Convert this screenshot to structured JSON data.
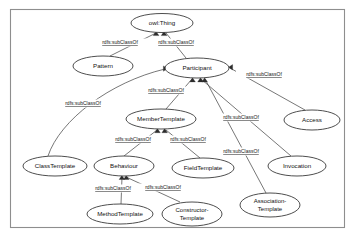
{
  "diagram": {
    "frame": {
      "x": 10,
      "y": 9,
      "width": 335,
      "height": 219
    },
    "edge_relation_label": "rdfs:subClassOf",
    "colors": {
      "background": "#ffffff",
      "node_stroke": "#3a3a3a",
      "node_fill": "#ffffff",
      "edge_stroke": "#4a4a4a",
      "text": "#111111",
      "frame_stroke": "#8e8e8e",
      "arrow_fill": "#2c2c2c"
    },
    "nodes": [
      {
        "id": "owl-thing",
        "label": "owl:Thing",
        "cx": 162,
        "cy": 23,
        "rx": 31,
        "ry": 9.5,
        "lines": [
          "owl:Thing"
        ]
      },
      {
        "id": "pattern",
        "label": "Pattern",
        "cx": 103,
        "cy": 66,
        "rx": 30,
        "ry": 10,
        "lines": [
          "Pattern"
        ]
      },
      {
        "id": "participant",
        "label": "Participant",
        "cx": 197,
        "cy": 68,
        "rx": 32,
        "ry": 10,
        "lines": [
          "Participant"
        ]
      },
      {
        "id": "access",
        "label": "Access",
        "cx": 312,
        "cy": 120,
        "rx": 28,
        "ry": 10,
        "lines": [
          "Access"
        ]
      },
      {
        "id": "member-template",
        "label": "MemberTemplate",
        "cx": 161,
        "cy": 119,
        "rx": 35,
        "ry": 10,
        "lines": [
          "MemberTemplate"
        ]
      },
      {
        "id": "class-template",
        "label": "ClassTemplate",
        "cx": 55,
        "cy": 166,
        "rx": 32,
        "ry": 10,
        "lines": [
          "ClassTemplate"
        ]
      },
      {
        "id": "behaviour",
        "label": "Behaviour",
        "cx": 124,
        "cy": 166,
        "rx": 30,
        "ry": 10,
        "lines": [
          "Behaviour"
        ]
      },
      {
        "id": "field-template",
        "label": "FieldTemplate",
        "cx": 203,
        "cy": 168,
        "rx": 31,
        "ry": 10,
        "lines": [
          "FieldTemplate"
        ]
      },
      {
        "id": "invocation",
        "label": "Invocation",
        "cx": 297,
        "cy": 166,
        "rx": 29,
        "ry": 10,
        "lines": [
          "Invocation"
        ]
      },
      {
        "id": "method-template",
        "label": "MethodTemplate",
        "cx": 120,
        "cy": 214,
        "rx": 33,
        "ry": 10,
        "lines": [
          "MethodTemplate"
        ]
      },
      {
        "id": "constructor-template",
        "label": "Constructor-Template",
        "cx": 192,
        "cy": 214,
        "rx": 30,
        "ry": 12,
        "lines": [
          "Constructor-",
          "Template"
        ]
      },
      {
        "id": "association-template",
        "label": "Association-Template",
        "cx": 270,
        "cy": 205,
        "rx": 30,
        "ry": 12,
        "lines": [
          "Association-",
          "Template"
        ]
      }
    ],
    "edges": [
      {
        "id": "pattern-owlthing",
        "from": "pattern",
        "to": "owl-thing",
        "label": "rdfs:subClassOf",
        "label_x": 120,
        "label_y": 43,
        "arrow_x": 156,
        "arrow_y": 32,
        "arrow_dir": "up"
      },
      {
        "id": "participant-owlthing",
        "from": "participant",
        "to": "owl-thing",
        "label": "rdfs:subClassOf",
        "label_x": 176,
        "label_y": 43,
        "arrow_x": 164,
        "arrow_y": 32,
        "arrow_dir": "up"
      },
      {
        "id": "classtemplate-participant",
        "from": "class-template",
        "to": "participant",
        "label": "rdfs:subClassOf",
        "label_x": 83,
        "label_y": 104,
        "arrow_x": 167,
        "arrow_y": 68,
        "arrow_dir": "right"
      },
      {
        "id": "membertemplate-participant",
        "from": "member-template",
        "to": "participant",
        "label": "rdfs:subClassOf",
        "label_x": 166,
        "label_y": 91,
        "arrow_x": 193,
        "arrow_y": 78,
        "arrow_dir": "up"
      },
      {
        "id": "access-participant",
        "from": "access",
        "to": "participant",
        "label": "rdfs:subClassOf",
        "label_x": 264,
        "label_y": 75,
        "arrow_x": 228,
        "arrow_y": 67,
        "arrow_dir": "left"
      },
      {
        "id": "invocation-participant",
        "from": "invocation",
        "to": "participant",
        "label": "rdfs:subClassOf",
        "label_x": 241,
        "label_y": 118,
        "arrow_x": 200,
        "arrow_y": 78,
        "arrow_dir": "up"
      },
      {
        "id": "associationtemplate-participant",
        "from": "association-template",
        "to": "participant",
        "label": "rdfs:subClassOf",
        "label_x": 241,
        "label_y": 152,
        "arrow_x": 203,
        "arrow_y": 78,
        "arrow_dir": "up"
      },
      {
        "id": "behaviour-membertemplate",
        "from": "behaviour",
        "to": "member-template",
        "label": "rdfs:subClassOf",
        "label_x": 133,
        "label_y": 140,
        "arrow_x": 157,
        "arrow_y": 129,
        "arrow_dir": "up"
      },
      {
        "id": "fieldtemplate-membertemplate",
        "from": "field-template",
        "to": "member-template",
        "label": "rdfs:subClassOf",
        "label_x": 188,
        "label_y": 140,
        "arrow_x": 164,
        "arrow_y": 129,
        "arrow_dir": "up"
      },
      {
        "id": "methodtemplate-behaviour",
        "from": "method-template",
        "to": "behaviour",
        "label": "rdfs:subClassOf",
        "label_x": 113,
        "label_y": 189,
        "arrow_x": 122,
        "arrow_y": 176,
        "arrow_dir": "up"
      },
      {
        "id": "constructortemplate-behaviour",
        "from": "constructor-template",
        "to": "behaviour",
        "label": "rdfs:subClassOf",
        "label_x": 163,
        "label_y": 188,
        "arrow_x": 125,
        "arrow_y": 176,
        "arrow_dir": "up"
      }
    ]
  }
}
